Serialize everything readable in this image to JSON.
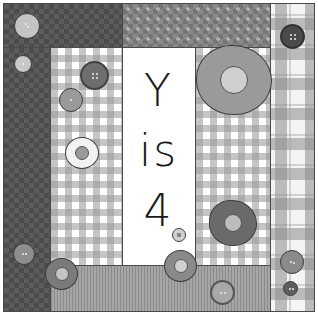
{
  "title": "Y is 4",
  "text_panel": {
    "line1": "Y",
    "line2": "is",
    "line3": "4"
  },
  "colors": {
    "dark_fabric": "#5c5c5c",
    "mid_fabric": "#8a8a8a",
    "light_fabric": "#c8c8c8",
    "white_panel": "#ffffff",
    "text": "#1a1a1a"
  },
  "panels": [
    {
      "name": "top-left-dark-argyle",
      "pattern": "dark-argyle"
    },
    {
      "name": "top-middle-argyle",
      "pattern": "mid-argyle"
    },
    {
      "name": "left-dark-strip",
      "pattern": "dark-argyle"
    },
    {
      "name": "left-gingham",
      "pattern": "gingham"
    },
    {
      "name": "center-text-panel",
      "pattern": "white"
    },
    {
      "name": "right-gingham",
      "pattern": "gingham"
    },
    {
      "name": "bottom-basketweave",
      "pattern": "basketweave"
    },
    {
      "name": "right-plaid",
      "pattern": "plaid"
    }
  ],
  "decorations": {
    "buttons": 10,
    "yoyos": 5
  }
}
